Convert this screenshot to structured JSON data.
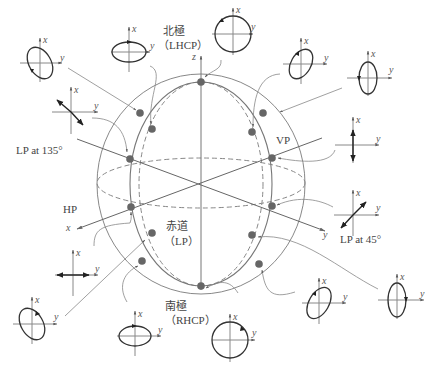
{
  "figure": {
    "type": "poincare-sphere",
    "axes": {
      "x": "x",
      "y": "y",
      "z": "z"
    },
    "labels": {
      "north_pole": "北極",
      "north_pole_sub": "（LHCP）",
      "south_pole": "南極",
      "south_pole_sub": "（RHCP）",
      "equator": "赤道",
      "equator_sub": "（LP）",
      "vp": "VP",
      "hp": "HP",
      "lp135": "LP at 135°",
      "lp45": "LP at 45°"
    },
    "insets": [
      {
        "id": "tl-ellipse-135",
        "pos": [
          35,
          45
        ],
        "kind": "tilted-ellipse-ccw"
      },
      {
        "id": "top-h-ellipse",
        "pos": [
          129,
          52
        ],
        "kind": "horizontal-ellipse"
      },
      {
        "id": "north-circle",
        "pos": [
          227,
          34
        ],
        "kind": "circle-left"
      },
      {
        "id": "tr-ellipse-45",
        "pos": [
          300,
          65
        ],
        "kind": "tilted-ellipse-45"
      },
      {
        "id": "tr-v-ellipse",
        "pos": [
          368,
          79
        ],
        "kind": "vertical-ellipse"
      },
      {
        "id": "lp135",
        "pos": [
          70,
          112
        ],
        "kind": "linear-135"
      },
      {
        "id": "vp",
        "pos": [
          352,
          145
        ],
        "kind": "linear-vertical"
      },
      {
        "id": "lp45",
        "pos": [
          353,
          213
        ],
        "kind": "linear-45"
      },
      {
        "id": "hp",
        "pos": [
          73,
          276
        ],
        "kind": "linear-horizontal"
      },
      {
        "id": "bl-ellipse",
        "pos": [
          31,
          325
        ],
        "kind": "tilted-ellipse-135-right"
      },
      {
        "id": "bottom-h-ellipse",
        "pos": [
          135,
          337
        ],
        "kind": "horizontal-ellipse-right"
      },
      {
        "id": "south-circle",
        "pos": [
          230,
          337
        ],
        "kind": "circle-right"
      },
      {
        "id": "br-ellipse-45",
        "pos": [
          320,
          303
        ],
        "kind": "tilted-ellipse-45-right"
      },
      {
        "id": "br-v-ellipse",
        "pos": [
          397,
          300
        ],
        "kind": "vertical-ellipse-right"
      }
    ],
    "points": [
      [
        201,
        82
      ],
      [
        140,
        113
      ],
      [
        152,
        129
      ],
      [
        130,
        159
      ],
      [
        131,
        207
      ],
      [
        152,
        233
      ],
      [
        142,
        261
      ],
      [
        201,
        286
      ],
      [
        263,
        113
      ],
      [
        252,
        132
      ],
      [
        272,
        158
      ],
      [
        272,
        206
      ],
      [
        252,
        235
      ],
      [
        259,
        264
      ]
    ]
  }
}
